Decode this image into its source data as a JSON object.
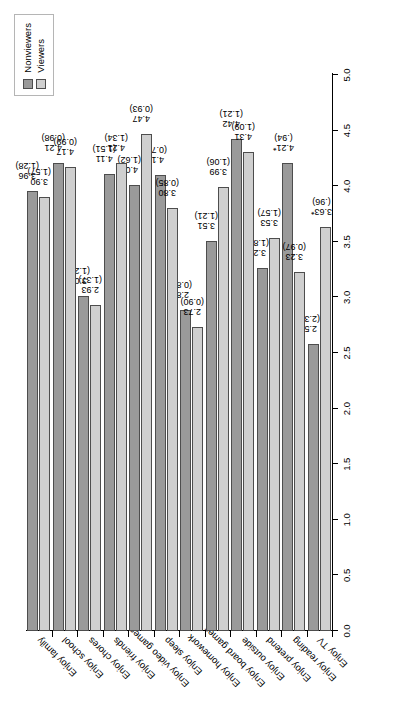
{
  "chart_data": {
    "type": "bar",
    "orientation": "horizontal",
    "title": "",
    "xlabel": "",
    "ylabel": "",
    "xlim": [
      0.0,
      5.0
    ],
    "xticks": [
      "0.0",
      "0.5",
      "1.0",
      "1.5",
      "2.0",
      "2.5",
      "3.0",
      "3.5",
      "4.0",
      "4.5",
      "5.0"
    ],
    "grid": false,
    "legend_position": "top-right",
    "categories": [
      "Enjoy TV",
      "Enjoy reading",
      "Enjoy pretend",
      "Enjoy outside",
      "Enjoy board games",
      "Enjoy homework",
      "Enjoy sleep",
      "Enjoy video games",
      "Enjoy friends",
      "Enjoy chores",
      "Enjoy school",
      "Enjoy family"
    ],
    "series": [
      {
        "name": "Nonviewers",
        "color": "#9a9a9a",
        "values": [
          2.58,
          4.21,
          3.26,
          4.42,
          3.51,
          2.89,
          4.1,
          4.01,
          4.11,
          3.01,
          4.21,
          3.96
        ],
        "value_labels": [
          "2.58",
          "4.21*",
          "3.26",
          "4.42",
          "3.51",
          "2.89",
          "4.10",
          "4.01",
          "4.11",
          "3.01",
          "4.21",
          "3.96"
        ],
        "sd_labels": [
          "(2.30)",
          "(.94)",
          "(1.88)",
          "(1.21)",
          "(1.21)",
          "(0.85)",
          "(0.72)",
          "(1.62)",
          "(1.51)",
          "(1.21)",
          "(0.98)",
          "(1.28)"
        ]
      },
      {
        "name": "Viewers",
        "color": "#cfcfcf",
        "values": [
          3.63,
          3.23,
          3.53,
          4.31,
          3.99,
          2.73,
          3.8,
          4.47,
          4.21,
          2.93,
          4.17,
          3.9
        ],
        "value_labels": [
          "3.63*",
          "3.23",
          "3.53",
          "4.31",
          "3.99",
          "2.73",
          "3.80",
          "4.47",
          "4.21",
          "2.93",
          "4.17",
          "3.90"
        ],
        "sd_labels": [
          "(.96)",
          "(0.97)",
          "(1.57)",
          "(1.09)",
          "(1.06)",
          "(0.90)",
          "(0.85)",
          "(0.93)",
          "(1.34)",
          "(1.37)",
          "(0.99)",
          "(1.57)"
        ]
      }
    ]
  },
  "legend": {
    "items": [
      {
        "label": "Nonviewers",
        "swatch": "nv"
      },
      {
        "label": "Viewers",
        "swatch": "vw"
      }
    ]
  }
}
